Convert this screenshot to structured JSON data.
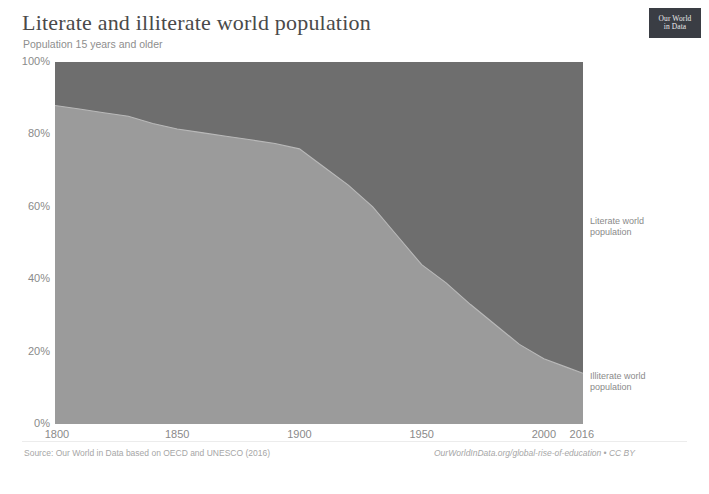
{
  "header": {
    "title": "Literate and illiterate world population",
    "subtitle": "Population 15 years and older"
  },
  "logo": {
    "line1": "Our World",
    "line2": "in Data"
  },
  "footer": {
    "source": "Source: Our World in Data based on OECD and UNESCO (2016)",
    "link": "OurWorldInData.org/global-rise-of-education • CC BY"
  },
  "annotations": {
    "literate": "Literate world\npopulation",
    "literate_line1": "Literate world",
    "literate_line2": "population",
    "illiterate_line1": "Illiterate world",
    "illiterate_line2": "population"
  },
  "colors": {
    "literate_area": "#6e6e6e",
    "illiterate_area": "#9b9b9b",
    "title": "#4a4a4a",
    "axis_text": "#8a8a8a",
    "logo_bg": "#3a3d44"
  },
  "chart_data": {
    "type": "area",
    "title": "Literate and illiterate world population",
    "subtitle": "Population 15 years and older",
    "xlabel": "",
    "ylabel": "",
    "stacked": true,
    "grid": false,
    "legend_position": "right-inline",
    "xlim": [
      1800,
      2016
    ],
    "ylim": [
      0,
      100
    ],
    "yticks": [
      0,
      20,
      40,
      60,
      80,
      100
    ],
    "ytick_labels": [
      "0%",
      "20%",
      "40%",
      "60%",
      "80%",
      "100%"
    ],
    "xticks": [
      1800,
      1850,
      1900,
      1950,
      2000,
      2016
    ],
    "xtick_labels": [
      "1800",
      "1850",
      "1900",
      "1950",
      "2000",
      "2016"
    ],
    "x": [
      1800,
      1810,
      1820,
      1830,
      1840,
      1850,
      1860,
      1870,
      1880,
      1890,
      1900,
      1910,
      1920,
      1930,
      1940,
      1950,
      1960,
      1970,
      1980,
      1990,
      2000,
      2010,
      2016
    ],
    "series": [
      {
        "name": "Illiterate world population",
        "color": "#9b9b9b",
        "values": [
          88.0,
          87.0,
          86.0,
          85.0,
          83.0,
          81.5,
          80.5,
          79.5,
          78.5,
          77.5,
          76.0,
          71.0,
          66.0,
          60.0,
          52.0,
          44.0,
          39.0,
          33.0,
          27.5,
          22.0,
          18.0,
          15.5,
          14.0
        ]
      },
      {
        "name": "Literate world population",
        "color": "#6e6e6e",
        "values": [
          12.0,
          13.0,
          14.0,
          15.0,
          17.0,
          18.5,
          19.5,
          20.5,
          21.5,
          22.5,
          24.0,
          29.0,
          34.0,
          40.0,
          48.0,
          56.0,
          61.0,
          67.0,
          72.5,
          78.0,
          82.0,
          84.5,
          86.0
        ]
      }
    ]
  }
}
